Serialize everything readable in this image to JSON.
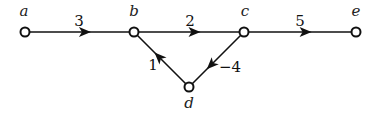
{
  "graph": {
    "directed": true,
    "nodes": [
      {
        "id": "a",
        "label": "a",
        "x": 25,
        "y": 32,
        "lx": 24,
        "ly": 16
      },
      {
        "id": "b",
        "label": "b",
        "x": 134,
        "y": 32,
        "lx": 134,
        "ly": 16
      },
      {
        "id": "c",
        "label": "c",
        "x": 244,
        "y": 32,
        "lx": 245,
        "ly": 16
      },
      {
        "id": "e",
        "label": "e",
        "x": 356,
        "y": 32,
        "lx": 356,
        "ly": 16
      },
      {
        "id": "d",
        "label": "d",
        "x": 189,
        "y": 87,
        "lx": 189,
        "ly": 108
      }
    ],
    "edges": [
      {
        "from": "a",
        "to": "b",
        "weight": "3",
        "wx": 79,
        "wy": 26,
        "arrow_t": 0.55
      },
      {
        "from": "b",
        "to": "c",
        "weight": "2",
        "wx": 190,
        "wy": 26,
        "arrow_t": 0.55
      },
      {
        "from": "c",
        "to": "e",
        "weight": "5",
        "wx": 300,
        "wy": 26,
        "arrow_t": 0.55
      },
      {
        "from": "c",
        "to": "d",
        "weight": "−4",
        "wx": 230,
        "wy": 72,
        "arrow_t": 0.6
      },
      {
        "from": "d",
        "to": "b",
        "weight": "1",
        "wx": 153,
        "wy": 70,
        "arrow_t": 0.55
      }
    ]
  },
  "colors": {
    "stroke": "#111111",
    "node_fill": "#ffffff"
  }
}
